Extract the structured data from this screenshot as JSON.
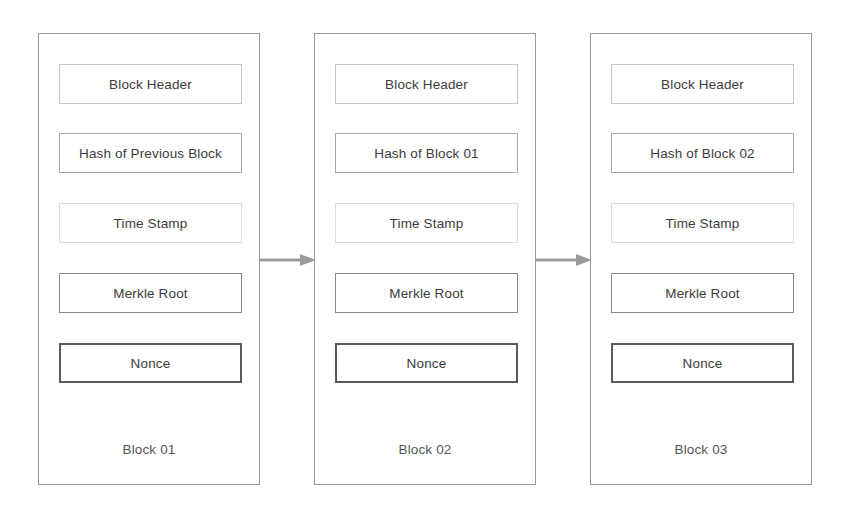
{
  "diagram": {
    "background_color": "#ffffff",
    "text_color": "#3b3b3b",
    "border_color": "#9a9a9a",
    "arrow_color": "#9b9b9b",
    "blocks": [
      {
        "label": "Block 01",
        "fields": [
          "Block Header",
          "Hash of Previous Block",
          "Time Stamp",
          "Merkle Root",
          "Nonce"
        ]
      },
      {
        "label": "Block 02",
        "fields": [
          "Block Header",
          "Hash of Block 01",
          "Time Stamp",
          "Merkle Root",
          "Nonce"
        ]
      },
      {
        "label": "Block 03",
        "fields": [
          "Block Header",
          "Hash of Block 02",
          "Time Stamp",
          "Merkle Root",
          "Nonce"
        ]
      }
    ],
    "connectors": [
      {
        "name": "arrow-block01-to-block02"
      },
      {
        "name": "arrow-block02-to-block03"
      }
    ]
  }
}
